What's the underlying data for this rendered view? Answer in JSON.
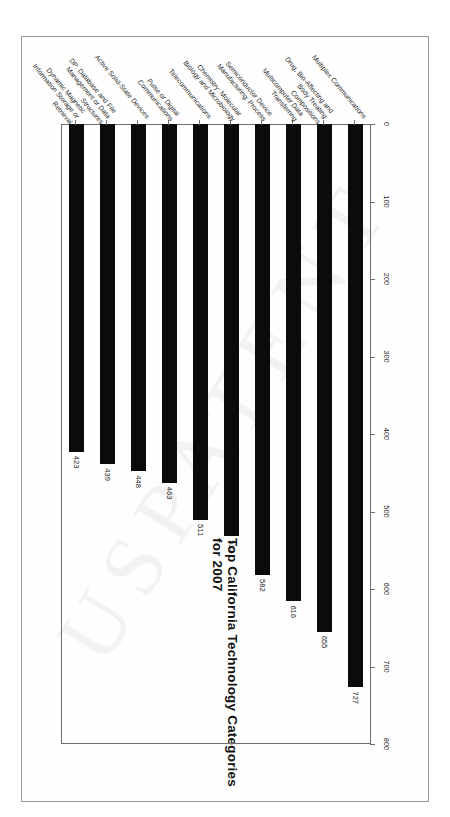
{
  "page": {
    "watermark_text": "USPATENT"
  },
  "chart_data": {
    "type": "bar",
    "orientation": "horizontal",
    "title": "Top California Technology Categories for 2007",
    "xlabel": "",
    "ylabel": "",
    "xlim": [
      0,
      800
    ],
    "grid": false,
    "legend": false,
    "tick_labels": [
      "0",
      "100",
      "200",
      "300",
      "400",
      "500",
      "600",
      "700",
      "800"
    ],
    "tick_values": [
      0,
      100,
      200,
      300,
      400,
      500,
      600,
      700,
      800
    ],
    "categories": [
      "Multiplex Communications",
      "Drug, Bio-Affecting and\nBody Treating\nCompositions",
      "Multicomputer Data\nTransferring",
      "Semiconductor Device\nManufacturing: Process",
      "Chemistry: Molecular\nBiology and Microbiology",
      "Telecommunications",
      "Pulse or Digital\nCommunications",
      "Active Solid-State Devices",
      "DP: Database and File\nManagement or Data\nStructures",
      "Dynamic Magnetic\nInformation Storage or\nRetrieval"
    ],
    "values": [
      727,
      655,
      616,
      582,
      532,
      511,
      463,
      448,
      439,
      423
    ],
    "value_labels": [
      "727",
      "655",
      "616",
      "582",
      "532",
      "511",
      "463",
      "448",
      "439",
      "423"
    ],
    "bar_color": "#0b0b0b",
    "axis_color": "#6d6d6d"
  }
}
